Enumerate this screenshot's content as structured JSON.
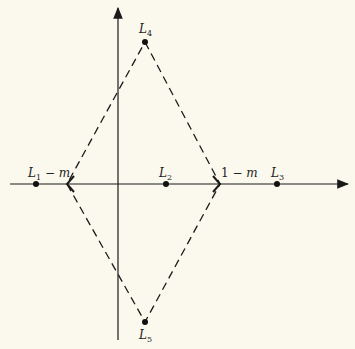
{
  "diagram": {
    "background": "#fbf9ee",
    "stroke": "#1a1a1a",
    "points": {
      "L1": {
        "base": "L",
        "sub": "1",
        "suffix": " − m"
      },
      "L2": {
        "base": "L",
        "sub": "2"
      },
      "L3": {
        "base": "L",
        "sub": "3"
      },
      "L4": {
        "base": "L",
        "sub": "4"
      },
      "L5": {
        "base": "L",
        "sub": "5"
      }
    },
    "right_vertex_label": {
      "prefix": "1 − ",
      "var": "m"
    }
  }
}
